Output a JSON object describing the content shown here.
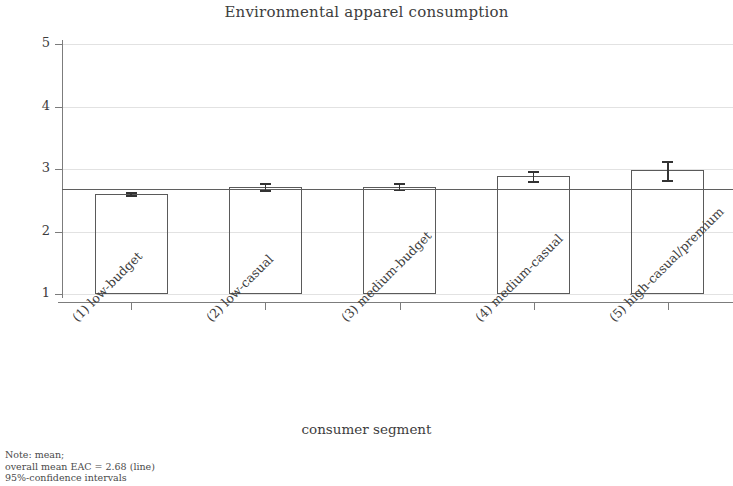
{
  "chart_data": {
    "type": "bar",
    "title": "Environmental apparel consumption",
    "xlabel": "consumer segment",
    "ylabel": "",
    "categories": [
      "(1) low-budget",
      "(2) low-casual",
      "(3) medium-budget",
      "(4) medium-casual",
      "(5) high-casual/premium"
    ],
    "values": [
      2.6,
      2.72,
      2.72,
      2.89,
      2.98
    ],
    "errors_low": [
      2.58,
      2.66,
      2.67,
      2.81,
      2.82
    ],
    "errors_high": [
      2.63,
      2.78,
      2.77,
      2.97,
      3.13
    ],
    "ylim": [
      1,
      5
    ],
    "yticks": [
      1,
      2,
      3,
      4,
      5
    ],
    "ytick_labels": [
      "1",
      "2",
      "3",
      "4",
      "5"
    ],
    "baseline": 1,
    "reference_line": {
      "label": "overall mean EAC",
      "value": 2.68
    },
    "grid": "horizontal",
    "legend": "none",
    "error_type": "95%-confidence intervals",
    "notes": [
      "Note: mean;",
      "overall mean EAC = 2.68 (line)",
      "95%-confidence intervals"
    ],
    "colors": {
      "bar_outline": "#5a5a5a",
      "bar_fill": "#ffffff",
      "gridline": "#e2e2e2",
      "axis": "#7c7c7c",
      "error_bar": "#333333",
      "reference_line": "#5f5f5f",
      "text": "#3d3d3d"
    }
  }
}
